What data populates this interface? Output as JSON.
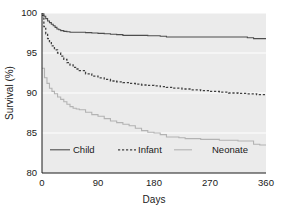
{
  "chart_data": {
    "type": "line",
    "title": "",
    "xlabel": "Days",
    "ylabel": "Survival (%)",
    "xlim": [
      0,
      360
    ],
    "ylim": [
      80,
      100
    ],
    "xticks": [
      0,
      90,
      180,
      270,
      360
    ],
    "yticks": [
      80,
      85,
      90,
      95,
      100
    ],
    "xtick_labels": [
      "0",
      "90",
      "180",
      "270",
      "360"
    ],
    "ytick_labels": [
      "80",
      "85",
      "90",
      "95",
      "100"
    ],
    "grid": "horizontal-white-on-gray",
    "legend_position": "inside-lower-left",
    "plot_background": "#ebebeb",
    "series": [
      {
        "name": "Child",
        "style": "solid",
        "color": "#4d4d4d",
        "x": [
          0,
          3,
          6,
          9,
          12,
          15,
          18,
          21,
          24,
          27,
          30,
          35,
          40,
          45,
          50,
          55,
          60,
          70,
          80,
          90,
          100,
          110,
          120,
          130,
          140,
          150,
          160,
          170,
          180,
          190,
          200,
          210,
          225,
          240,
          255,
          270,
          285,
          300,
          315,
          330,
          340,
          350,
          360
        ],
        "y": [
          99.9,
          99.6,
          99.3,
          99.0,
          98.8,
          98.6,
          98.4,
          98.2,
          98.0,
          97.9,
          97.8,
          97.7,
          97.65,
          97.6,
          97.6,
          97.6,
          97.6,
          97.55,
          97.5,
          97.45,
          97.4,
          97.35,
          97.3,
          97.2,
          97.2,
          97.2,
          97.2,
          97.15,
          97.15,
          97.1,
          97.0,
          97.0,
          97.0,
          97.0,
          97.0,
          97.0,
          97.0,
          97.0,
          97.0,
          96.9,
          96.8,
          96.8,
          96.8
        ]
      },
      {
        "name": "Infant",
        "style": "dashed",
        "color": "#404040",
        "x": [
          0,
          3,
          6,
          9,
          12,
          15,
          20,
          25,
          30,
          35,
          40,
          45,
          50,
          55,
          60,
          70,
          80,
          90,
          100,
          110,
          120,
          130,
          140,
          150,
          160,
          170,
          180,
          190,
          200,
          210,
          225,
          240,
          255,
          270,
          285,
          300,
          315,
          330,
          345,
          360
        ],
        "y": [
          99.7,
          98.3,
          97.4,
          96.8,
          96.3,
          95.9,
          95.4,
          95.0,
          94.6,
          94.2,
          93.8,
          93.5,
          93.2,
          93.0,
          92.8,
          92.4,
          92.1,
          91.9,
          91.7,
          91.5,
          91.4,
          91.3,
          91.2,
          91.1,
          91.0,
          90.95,
          90.9,
          90.8,
          90.7,
          90.6,
          90.5,
          90.4,
          90.3,
          90.2,
          90.1,
          90.0,
          89.95,
          89.9,
          89.8,
          89.7
        ]
      },
      {
        "name": "Neonate",
        "style": "solid",
        "color": "#b3b3b3",
        "x": [
          0,
          4,
          8,
          12,
          16,
          20,
          25,
          30,
          35,
          40,
          45,
          50,
          55,
          60,
          70,
          80,
          90,
          100,
          110,
          120,
          130,
          140,
          150,
          160,
          170,
          180,
          190,
          200,
          210,
          220,
          230,
          240,
          255,
          270,
          285,
          300,
          315,
          330,
          340,
          350,
          360
        ],
        "y": [
          93.1,
          91.9,
          91.2,
          90.6,
          90.2,
          89.9,
          89.5,
          89.2,
          88.9,
          88.6,
          88.3,
          88.1,
          88.0,
          87.9,
          87.6,
          87.3,
          87.1,
          86.8,
          86.5,
          86.3,
          86.1,
          85.9,
          85.6,
          85.3,
          85.1,
          85.0,
          84.8,
          84.5,
          84.5,
          84.4,
          84.3,
          84.3,
          84.2,
          84.2,
          84.1,
          84.1,
          84.0,
          84.0,
          83.6,
          83.5,
          83.5
        ]
      }
    ],
    "legend": [
      {
        "label": "Child",
        "style": "solid",
        "color": "#4d4d4d"
      },
      {
        "label": "Infant",
        "style": "dashed",
        "color": "#404040"
      },
      {
        "label": "Neonate",
        "style": "solid",
        "color": "#b3b3b3"
      }
    ]
  }
}
